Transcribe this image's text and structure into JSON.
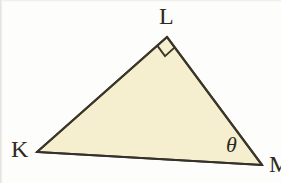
{
  "figure": {
    "type": "geometry-diagram",
    "background_color": "#fdfdfb",
    "fill_color": "#f5efcf",
    "stroke_color": "#3a3528",
    "label_color": "#2f2b22",
    "stroke_width": 2,
    "vertices": [
      {
        "name": "K",
        "label": "K",
        "x": 37,
        "y": 152
      },
      {
        "name": "L",
        "label": "L",
        "x": 167,
        "y": 37
      },
      {
        "name": "M",
        "label": "M",
        "x": 262,
        "y": 165
      }
    ],
    "edges": [
      {
        "name": "KL",
        "from": "K",
        "to": "L"
      },
      {
        "name": "LM",
        "from": "L",
        "to": "M"
      },
      {
        "name": "KM",
        "from": "K",
        "to": "M"
      }
    ],
    "angle_markers": [
      {
        "name": "right-angle-at-L",
        "at_vertex": "L",
        "kind": "right-angle-square",
        "size": 13
      },
      {
        "name": "theta-at-M",
        "at_vertex": "M",
        "kind": "labeled-angle",
        "label": "θ"
      }
    ],
    "labels": {
      "K": "K",
      "L": "L",
      "M": "M",
      "theta": "θ"
    }
  }
}
